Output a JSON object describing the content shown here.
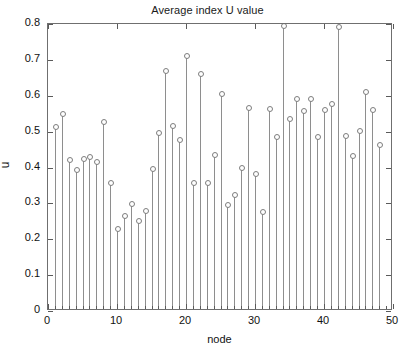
{
  "chart_data": {
    "type": "stem",
    "title": "Average index U value",
    "xlabel": "node",
    "ylabel": "u",
    "xlim": [
      0,
      50
    ],
    "ylim": [
      0,
      0.8
    ],
    "grid": false,
    "legend": null,
    "xticks": [
      0,
      10,
      20,
      30,
      40,
      50
    ],
    "xticklabels": [
      "0",
      "10",
      "20",
      "30",
      "40",
      "50"
    ],
    "yticks": [
      0,
      0.1,
      0.2,
      0.3,
      0.4,
      0.5,
      0.6,
      0.7,
      0.8
    ],
    "yticklabels": [
      "0",
      "0.1",
      "0.2",
      "0.3",
      "0.4",
      "0.5",
      "0.6",
      "0.7",
      "0.8"
    ],
    "marker": "open-circle",
    "marker_color": "#7d7d7d",
    "line_color": "#8e8e8e",
    "x": [
      1,
      2,
      3,
      4,
      5,
      6,
      7,
      8,
      9,
      10,
      11,
      12,
      13,
      14,
      15,
      16,
      17,
      18,
      19,
      20,
      21,
      22,
      23,
      24,
      25,
      26,
      27,
      28,
      29,
      30,
      31,
      32,
      33,
      34,
      35,
      36,
      37,
      38,
      39,
      40,
      41,
      42,
      43,
      44,
      45,
      46,
      47,
      48
    ],
    "values": [
      0.512,
      0.548,
      0.42,
      0.393,
      0.423,
      0.429,
      0.415,
      0.527,
      0.358,
      0.228,
      0.264,
      0.297,
      0.252,
      0.279,
      0.397,
      0.497,
      0.668,
      0.516,
      0.477,
      0.711,
      0.358,
      0.661,
      0.357,
      0.435,
      0.604,
      0.296,
      0.324,
      0.399,
      0.565,
      0.383,
      0.276,
      0.564,
      0.484,
      0.794,
      0.535,
      0.59,
      0.558,
      0.591,
      0.484,
      0.561,
      0.577,
      0.792,
      0.489,
      0.431,
      0.502,
      0.611,
      0.561,
      0.462
    ]
  }
}
